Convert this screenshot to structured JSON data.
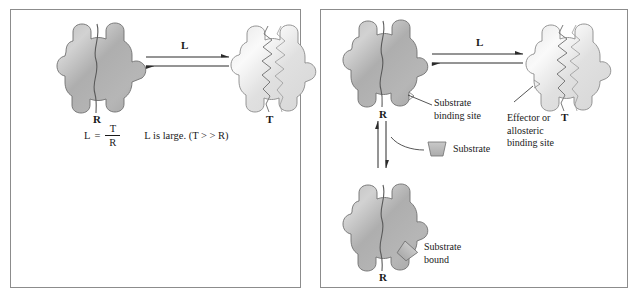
{
  "figure": {
    "background_color": "#ffffff",
    "border_color": "#8c8c8c",
    "text_color": "#1a1a1a"
  },
  "colors": {
    "r_state_fill_dark": "#a6a6a6",
    "r_state_fill_light": "#cfcfcf",
    "t_state_fill_dark": "#dcdcdc",
    "t_state_fill_light": "#f4f4f4",
    "outline": "#6f6f6f",
    "substrate_fill": "#b8b8b8",
    "arrow_color": "#2b2b2b"
  },
  "left_panel": {
    "r_state_label": "R",
    "t_state_label": "T",
    "arrow_label": "L",
    "equation": {
      "lhs": "L",
      "equals": "=",
      "numerator": "T",
      "denominator": "R",
      "note": "L is large.  (T > > R)"
    }
  },
  "right_panel": {
    "r_state_label": "R",
    "t_state_label": "T",
    "r_bound_state_label": "R",
    "arrow_label": "L",
    "callouts": {
      "substrate_binding_site": [
        "Substrate",
        "binding site"
      ],
      "effector_allosteric_site": [
        "Effector or",
        "allosteric",
        "binding site"
      ],
      "substrate_legend": "Substrate",
      "substrate_bound": [
        "Substrate",
        "bound"
      ]
    }
  }
}
